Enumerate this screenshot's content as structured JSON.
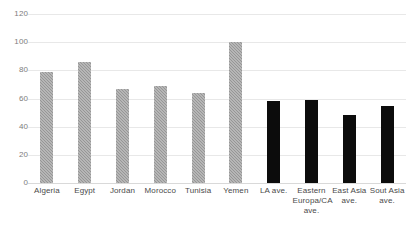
{
  "chart_data": {
    "type": "bar",
    "title": "",
    "subtitle": "",
    "xlabel": "",
    "ylabel": "",
    "ylim": [
      0,
      120
    ],
    "yticks": [
      0,
      20,
      40,
      60,
      80,
      100,
      120
    ],
    "grid": true,
    "legend": "none",
    "categories": [
      "Algeria",
      "Egypt",
      "Jordan",
      "Morocco",
      "Tunisia",
      "Yemen",
      "LA ave.",
      "Eastern Europa/CA ave.",
      "East Asia ave.",
      "Sout Asia ave."
    ],
    "values": [
      79,
      86,
      67,
      69,
      64,
      100,
      58,
      59,
      48,
      55
    ],
    "bar_colors": [
      "#969696",
      "#969696",
      "#969696",
      "#969696",
      "#969696",
      "#969696",
      "#0c0c0c",
      "#0c0c0c",
      "#0c0c0c",
      "#0c0c0c"
    ],
    "bar_styles": [
      "gray",
      "gray",
      "gray",
      "gray",
      "gray",
      "gray",
      "black",
      "black",
      "black",
      "black"
    ],
    "colors": {
      "country_bar": "#969696",
      "average_bar": "#0c0c0c",
      "gridline": "#e8e8e8",
      "tick_text": "#7d7d7d",
      "label_text": "#4a4a4a",
      "background": "#ffffff"
    }
  }
}
